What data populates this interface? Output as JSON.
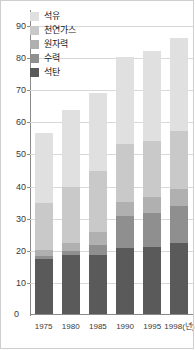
{
  "chart_data": {
    "type": "bar",
    "subtype": "stacked-bar",
    "title": "",
    "xlabel": "",
    "ylabel": "",
    "categories": [
      "1975",
      "1980",
      "1985",
      "1990",
      "1995",
      "1998"
    ],
    "x_axis_unit_label": "1998(년)",
    "ylim": [
      0,
      95
    ],
    "y_ticks": [
      10,
      20,
      30,
      40,
      50,
      60,
      70,
      80,
      90
    ],
    "grid": true,
    "legend_position": "top-left",
    "series": [
      {
        "name": "석유",
        "color": "#e0e0e0",
        "values": [
          22.0,
          24.0,
          24.5,
          27.0,
          28.0,
          29.0
        ]
      },
      {
        "name": "천연가스",
        "color": "#c9c9c9",
        "values": [
          14.5,
          17.5,
          19.0,
          18.0,
          17.5,
          18.0
        ]
      },
      {
        "name": "원자력",
        "color": "#b0b0b0",
        "values": [
          2.0,
          2.5,
          4.0,
          4.5,
          5.0,
          5.5
        ]
      },
      {
        "name": "수력",
        "color": "#8f8f8f",
        "values": [
          1.0,
          1.0,
          3.0,
          10.0,
          10.5,
          11.5
        ]
      },
      {
        "name": "석탄",
        "color": "#5a5a5a",
        "values": [
          17.0,
          18.5,
          18.5,
          20.5,
          21.0,
          22.0
        ]
      }
    ],
    "totals": [
      56.5,
      63.5,
      69.0,
      80.0,
      82.0,
      86.0
    ]
  },
  "legend": {
    "items": [
      {
        "label": "석유",
        "color": "#e0e0e0"
      },
      {
        "label": "천연가스",
        "color": "#c9c9c9"
      },
      {
        "label": "원자력",
        "color": "#b0b0b0"
      },
      {
        "label": "수력",
        "color": "#8f8f8f"
      },
      {
        "label": "석탄",
        "color": "#5a5a5a"
      }
    ]
  },
  "axes": {
    "y_tick_labels": [
      "90",
      "80",
      "70",
      "60",
      "50",
      "40",
      "30",
      "20",
      "10"
    ],
    "zero_label": "0",
    "x_tick_labels": [
      "1975",
      "1980",
      "1985",
      "1990",
      "1995",
      "1998(년)"
    ]
  },
  "colors": {
    "gridline": "#d8d8d8",
    "axis": "#8a8a8a",
    "text": "#3a3a3a",
    "frame": "#cfcfcf",
    "background": "#ffffff"
  }
}
